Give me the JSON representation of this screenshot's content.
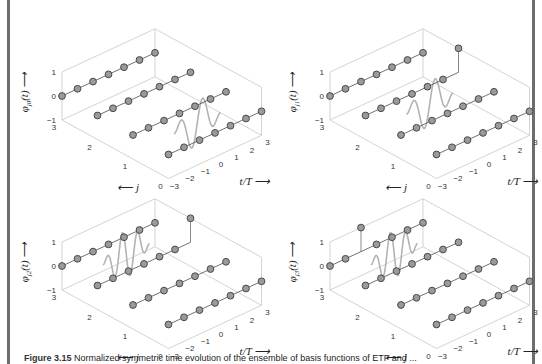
{
  "figure": {
    "caption_label": "Figure 3.15",
    "caption_text": "Normalized symmetric time evolution of the ensemble of basis functions of ETF and ...",
    "panels": [
      {
        "id": "top-left",
        "ylabel": "φj0(t)",
        "ylabel_base": "φ",
        "ylabel_sub": "j0",
        "ylabel_arg": "(t)"
      },
      {
        "id": "top-right",
        "ylabel": "φj1(t)",
        "ylabel_base": "φ",
        "ylabel_sub": "j1",
        "ylabel_arg": "(t)"
      },
      {
        "id": "bottom-left",
        "ylabel": "φj2(t)",
        "ylabel_base": "φ",
        "ylabel_sub": "j2",
        "ylabel_arg": "(t)"
      },
      {
        "id": "bottom-right",
        "ylabel": "φj3(t)",
        "ylabel_base": "φ",
        "ylabel_sub": "j3",
        "ylabel_arg": "(t)"
      }
    ],
    "axes": {
      "z_ticks": [
        "1",
        "0",
        "−1"
      ],
      "j_ticks": [
        "3",
        "2",
        "1",
        "0"
      ],
      "t_ticks": [
        "−3",
        "−2",
        "−1",
        "0",
        "1",
        "2",
        "3"
      ],
      "j_label": "j",
      "t_label": "t/T",
      "arrow": "⟶",
      "arrow_left": "⟵",
      "arrow_up": "⟶"
    }
  },
  "chart_data": [
    {
      "type": "line",
      "title": "φj0(t)",
      "xlabel": "t/T",
      "ylabel": "j",
      "zlabel": "φj0(t)",
      "x_range": [
        -3,
        3
      ],
      "y_range": [
        0,
        3
      ],
      "z_range": [
        -1,
        1
      ],
      "series": [
        {
          "name": "j=3 samples",
          "x": [
            -3,
            -2,
            -1,
            0,
            1,
            2,
            3
          ],
          "z": [
            0,
            0,
            0,
            0,
            0,
            0,
            0
          ]
        },
        {
          "name": "j=2 samples",
          "x": [
            -3,
            -2,
            -1,
            0,
            1,
            2,
            3
          ],
          "z": [
            0,
            0,
            0,
            0,
            0,
            0,
            0
          ]
        },
        {
          "name": "j=1 samples",
          "x": [
            -3,
            -2,
            -1,
            0,
            1,
            2,
            3
          ],
          "z": [
            0,
            0,
            0,
            0,
            0,
            0,
            0
          ]
        },
        {
          "name": "j=0 samples",
          "x": [
            -3,
            -2,
            -1,
            0,
            1,
            2,
            3
          ],
          "z": [
            0,
            0,
            0,
            0,
            0,
            0,
            0
          ]
        },
        {
          "name": "continuous wave at j=0.5",
          "x": [
            -1.5,
            1.5
          ],
          "z_amplitude": 1,
          "cycles": 2
        }
      ],
      "grid": false
    },
    {
      "type": "line",
      "title": "φj1(t)",
      "xlabel": "t/T",
      "ylabel": "j",
      "zlabel": "φj1(t)",
      "x_range": [
        -3,
        3
      ],
      "y_range": [
        0,
        3
      ],
      "z_range": [
        -1,
        1
      ],
      "series": [
        {
          "name": "j=3 samples",
          "x": [
            -3,
            -2,
            -1,
            0,
            1,
            2,
            3
          ],
          "z": [
            0,
            0,
            0,
            0,
            0,
            0,
            0
          ]
        },
        {
          "name": "j=2 samples",
          "x": [
            -3,
            -2,
            -1,
            0,
            1,
            2,
            3
          ],
          "z": [
            0,
            0,
            0,
            0,
            0,
            0,
            1
          ]
        },
        {
          "name": "j=1 samples",
          "x": [
            -3,
            -2,
            -1,
            0,
            1,
            2,
            3
          ],
          "z": [
            0,
            0,
            0,
            0,
            0,
            0,
            0
          ]
        },
        {
          "name": "j=0 samples",
          "x": [
            -3,
            -2,
            -1,
            0,
            1,
            2,
            3
          ],
          "z": [
            0,
            0,
            0,
            0,
            0,
            0,
            0
          ]
        },
        {
          "name": "continuous wave at j=1.5",
          "x": [
            -1.5,
            1.5
          ],
          "z_amplitude": 1,
          "cycles": 2
        }
      ],
      "grid": false
    },
    {
      "type": "line",
      "title": "φj2(t)",
      "xlabel": "t/T",
      "ylabel": "j",
      "zlabel": "φj2(t)",
      "x_range": [
        -3,
        3
      ],
      "y_range": [
        0,
        3
      ],
      "z_range": [
        -1,
        1
      ],
      "series": [
        {
          "name": "j=3 samples",
          "x": [
            -3,
            -2,
            -1,
            0,
            1,
            2,
            3
          ],
          "z": [
            0,
            0,
            0,
            0,
            0,
            0,
            0
          ]
        },
        {
          "name": "j=2 samples",
          "x": [
            -3,
            -2,
            -1,
            0,
            1,
            2,
            3
          ],
          "z": [
            0,
            0,
            0,
            0,
            0,
            0,
            1
          ]
        },
        {
          "name": "j=1 samples",
          "x": [
            -3,
            -2,
            -1,
            0,
            1,
            2,
            3
          ],
          "z": [
            0,
            0,
            0,
            0,
            0,
            0,
            0
          ]
        },
        {
          "name": "j=0 samples",
          "x": [
            -3,
            -2,
            -1,
            0,
            1,
            2,
            3
          ],
          "z": [
            0,
            0,
            0,
            0,
            0,
            0,
            0
          ]
        },
        {
          "name": "continuous wave at j=2.5",
          "x": [
            -1.5,
            1.5
          ],
          "z_amplitude": 1,
          "cycles": 3
        }
      ],
      "grid": false
    },
    {
      "type": "line",
      "title": "φj3(t)",
      "xlabel": "t/T",
      "ylabel": "j",
      "zlabel": "φj3(t)",
      "x_range": [
        -3,
        3
      ],
      "y_range": [
        0,
        3
      ],
      "z_range": [
        -1,
        1
      ],
      "series": [
        {
          "name": "j=3 samples",
          "x": [
            -3,
            -2,
            -1,
            0,
            1,
            2,
            3
          ],
          "z": [
            0,
            0,
            1,
            0,
            0,
            0,
            0
          ]
        },
        {
          "name": "j=2 samples",
          "x": [
            -3,
            -2,
            -1,
            0,
            1,
            2,
            3
          ],
          "z": [
            0,
            0,
            0,
            0,
            0,
            0,
            0
          ]
        },
        {
          "name": "j=1 samples",
          "x": [
            -3,
            -2,
            -1,
            0,
            1,
            2,
            3
          ],
          "z": [
            0,
            0,
            0,
            0,
            0,
            0,
            0
          ]
        },
        {
          "name": "j=0 samples",
          "x": [
            -3,
            -2,
            -1,
            0,
            1,
            2,
            3
          ],
          "z": [
            0,
            0,
            0,
            0,
            0,
            0,
            0
          ]
        },
        {
          "name": "continuous wave at j=2.5",
          "x": [
            -1.5,
            1.5
          ],
          "z_amplitude": 1,
          "cycles": 3
        }
      ],
      "grid": false
    }
  ]
}
